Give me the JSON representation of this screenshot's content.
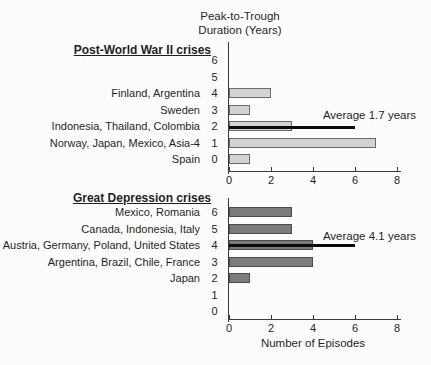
{
  "page": {
    "background": "#fcfcfc",
    "text_color": "#1f1f1f"
  },
  "header": {
    "axis_title_line1": "Peak-to-Trough",
    "axis_title_line2": "Duration (Years)"
  },
  "chart_data": [
    {
      "type": "bar",
      "orientation": "horizontal",
      "title": "Post-World War II crises",
      "ylabel": "Peak-to-Trough Duration (Years)",
      "xlabel": "",
      "xlim": [
        0,
        8
      ],
      "x_ticks": [
        0,
        2,
        4,
        6,
        8
      ],
      "bar_color": "#d3d3d3",
      "bar_border": "#6b6b6b",
      "rows": [
        {
          "duration": 6,
          "label": "",
          "episodes": 0
        },
        {
          "duration": 5,
          "label": "",
          "episodes": 0
        },
        {
          "duration": 4,
          "label": "Finland, Argentina",
          "episodes": 2
        },
        {
          "duration": 3,
          "label": "Sweden",
          "episodes": 1
        },
        {
          "duration": 2,
          "label": "Indonesia, Thailand, Colombia",
          "episodes": 3
        },
        {
          "duration": 1,
          "label": "Norway, Japan, Mexico, Asia-4",
          "episodes": 7
        },
        {
          "duration": 0,
          "label": "Spain",
          "episodes": 1
        }
      ],
      "annotation": {
        "text": "Average 1.7 years",
        "value_years": 1.7,
        "line_at_duration": 2,
        "line_span_episodes": [
          0,
          6
        ],
        "line_color": "#0a0a0a"
      }
    },
    {
      "type": "bar",
      "orientation": "horizontal",
      "title": "Great Depression crises",
      "ylabel": "Peak-to-Trough Duration (Years)",
      "xlabel": "Number of Episodes",
      "xlim": [
        0,
        8
      ],
      "x_ticks": [
        0,
        2,
        4,
        6,
        8
      ],
      "bar_color": "#7c7c7c",
      "bar_border": "#4a4a4a",
      "rows": [
        {
          "duration": 6,
          "label": "Mexico, Romania",
          "episodes": 3
        },
        {
          "duration": 5,
          "label": "Canada, Indonesia, Italy",
          "episodes": 3
        },
        {
          "duration": 4,
          "label": "Austria, Germany, Poland, United States",
          "episodes": 4
        },
        {
          "duration": 3,
          "label": "Argentina, Brazil, Chile, France",
          "episodes": 4
        },
        {
          "duration": 2,
          "label": "Japan",
          "episodes": 1
        },
        {
          "duration": 1,
          "label": "",
          "episodes": 0
        },
        {
          "duration": 0,
          "label": "",
          "episodes": 0
        }
      ],
      "annotation": {
        "text": "Average 4.1 years",
        "value_years": 4.1,
        "line_at_duration": 4,
        "line_span_episodes": [
          0,
          6
        ],
        "line_color": "#0a0a0a"
      }
    }
  ]
}
